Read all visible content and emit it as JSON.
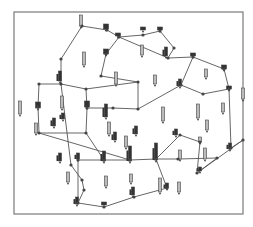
{
  "diagram": {
    "type": "network-graph-with-bar-glyphs",
    "frame": {
      "x": 14,
      "y": 12,
      "w": 229,
      "h": 202,
      "stroke": "#7a7a7a"
    },
    "colors": {
      "edge": "#555555",
      "node": "#444444",
      "bar_dark": "#333333",
      "bar_light": "#bbbbbb",
      "bar_outline": "#444444"
    },
    "nodes": [
      {
        "id": 1,
        "x": 82,
        "y": 26
      },
      {
        "id": 2,
        "x": 107,
        "y": 30
      },
      {
        "id": 3,
        "x": 119,
        "y": 37
      },
      {
        "id": 4,
        "x": 143,
        "y": 35
      },
      {
        "id": 5,
        "x": 160,
        "y": 31
      },
      {
        "id": 6,
        "x": 174,
        "y": 48
      },
      {
        "id": 7,
        "x": 168,
        "y": 58
      },
      {
        "id": 8,
        "x": 193,
        "y": 57
      },
      {
        "id": 9,
        "x": 106,
        "y": 54
      },
      {
        "id": 10,
        "x": 61,
        "y": 59
      },
      {
        "id": 11,
        "x": 61,
        "y": 84
      },
      {
        "id": 12,
        "x": 39,
        "y": 84
      },
      {
        "id": 13,
        "x": 101,
        "y": 76
      },
      {
        "id": 14,
        "x": 86,
        "y": 89
      },
      {
        "id": 15,
        "x": 138,
        "y": 82
      },
      {
        "id": 16,
        "x": 224,
        "y": 69
      },
      {
        "id": 17,
        "x": 181,
        "y": 85
      },
      {
        "id": 18,
        "x": 203,
        "y": 94
      },
      {
        "id": 19,
        "x": 229,
        "y": 89
      },
      {
        "id": 20,
        "x": 38,
        "y": 107
      },
      {
        "id": 21,
        "x": 87,
        "y": 108
      },
      {
        "id": 22,
        "x": 113,
        "y": 108
      },
      {
        "id": 23,
        "x": 138,
        "y": 109
      },
      {
        "id": 24,
        "x": 39,
        "y": 133
      },
      {
        "id": 25,
        "x": 86,
        "y": 133
      },
      {
        "id": 26,
        "x": 180,
        "y": 135
      },
      {
        "id": 27,
        "x": 200,
        "y": 142
      },
      {
        "id": 28,
        "x": 243,
        "y": 140
      },
      {
        "id": 29,
        "x": 231,
        "y": 148
      },
      {
        "id": 30,
        "x": 130,
        "y": 160
      },
      {
        "id": 31,
        "x": 156,
        "y": 159
      },
      {
        "id": 32,
        "x": 78,
        "y": 160
      },
      {
        "id": 33,
        "x": 104,
        "y": 160
      },
      {
        "id": 34,
        "x": 178,
        "y": 159
      },
      {
        "id": 35,
        "x": 217,
        "y": 158
      },
      {
        "id": 36,
        "x": 197,
        "y": 173
      },
      {
        "id": 37,
        "x": 167,
        "y": 188
      },
      {
        "id": 38,
        "x": 134,
        "y": 197
      },
      {
        "id": 39,
        "x": 104,
        "y": 207
      },
      {
        "id": 40,
        "x": 78,
        "y": 203
      },
      {
        "id": 41,
        "x": 71,
        "y": 165
      },
      {
        "id": 42,
        "x": 82,
        "y": 180
      },
      {
        "id": 43,
        "x": 84,
        "y": 190
      }
    ],
    "edges": [
      [
        1,
        2
      ],
      [
        2,
        3
      ],
      [
        3,
        4
      ],
      [
        4,
        5
      ],
      [
        5,
        6
      ],
      [
        3,
        7
      ],
      [
        6,
        7
      ],
      [
        7,
        8
      ],
      [
        1,
        10
      ],
      [
        10,
        11
      ],
      [
        11,
        12
      ],
      [
        11,
        14
      ],
      [
        14,
        15
      ],
      [
        15,
        13
      ],
      [
        13,
        9
      ],
      [
        9,
        3
      ],
      [
        15,
        23
      ],
      [
        14,
        21
      ],
      [
        21,
        22
      ],
      [
        22,
        23
      ],
      [
        23,
        17
      ],
      [
        17,
        8
      ],
      [
        8,
        16
      ],
      [
        16,
        19
      ],
      [
        19,
        29
      ],
      [
        17,
        18
      ],
      [
        18,
        19
      ],
      [
        12,
        20
      ],
      [
        20,
        24
      ],
      [
        24,
        25
      ],
      [
        25,
        21
      ],
      [
        25,
        33
      ],
      [
        24,
        30
      ],
      [
        30,
        31
      ],
      [
        31,
        34
      ],
      [
        34,
        35
      ],
      [
        35,
        36
      ],
      [
        36,
        28
      ],
      [
        28,
        29
      ],
      [
        26,
        27
      ],
      [
        27,
        36
      ],
      [
        26,
        31
      ],
      [
        32,
        33
      ],
      [
        33,
        30
      ],
      [
        31,
        37
      ],
      [
        37,
        38
      ],
      [
        11,
        41
      ],
      [
        41,
        42
      ],
      [
        42,
        43
      ],
      [
        43,
        40
      ],
      [
        40,
        39
      ],
      [
        39,
        38
      ],
      [
        32,
        40
      ]
    ],
    "glyphs": [
      {
        "x": 81,
        "y": 15,
        "h": 11,
        "style": "light"
      },
      {
        "x": 106,
        "y": 24,
        "h": 5,
        "style": "dark-cap"
      },
      {
        "x": 118,
        "y": 33,
        "h": 3,
        "style": "dark-cap"
      },
      {
        "x": 84,
        "y": 52,
        "h": 13,
        "style": "light"
      },
      {
        "x": 106,
        "y": 49,
        "h": 5,
        "style": "dark-cap"
      },
      {
        "x": 143,
        "y": 27,
        "h": 3,
        "style": "dark-cap"
      },
      {
        "x": 160,
        "y": 27,
        "h": 3,
        "style": "dark-cap"
      },
      {
        "x": 142,
        "y": 45,
        "h": 10,
        "style": "light"
      },
      {
        "x": 166,
        "y": 47,
        "h": 9,
        "style": "dark"
      },
      {
        "x": 193,
        "y": 53,
        "h": 3,
        "style": "dark-cap"
      },
      {
        "x": 60,
        "y": 71,
        "h": 10,
        "style": "dark"
      },
      {
        "x": 62,
        "y": 96,
        "h": 12,
        "style": "light"
      },
      {
        "x": 116,
        "y": 72,
        "h": 12,
        "style": "light"
      },
      {
        "x": 155,
        "y": 75,
        "h": 9,
        "style": "light"
      },
      {
        "x": 20,
        "y": 101,
        "h": 13,
        "style": "light"
      },
      {
        "x": 38,
        "y": 102,
        "h": 6,
        "style": "dark-cap"
      },
      {
        "x": 87,
        "y": 101,
        "h": 6,
        "style": "dark-cap"
      },
      {
        "x": 163,
        "y": 107,
        "h": 14,
        "style": "light"
      },
      {
        "x": 180,
        "y": 79,
        "h": 7,
        "style": "dark"
      },
      {
        "x": 206,
        "y": 69,
        "h": 8,
        "style": "light"
      },
      {
        "x": 224,
        "y": 65,
        "h": 4,
        "style": "dark-cap"
      },
      {
        "x": 243,
        "y": 88,
        "h": 11,
        "style": "light"
      },
      {
        "x": 229,
        "y": 86,
        "h": 3,
        "style": "dark-cap"
      },
      {
        "x": 36,
        "y": 123,
        "h": 10,
        "style": "light"
      },
      {
        "x": 54,
        "y": 118,
        "h": 8,
        "style": "dark"
      },
      {
        "x": 63,
        "y": 113,
        "h": 6,
        "style": "dark"
      },
      {
        "x": 106,
        "y": 104,
        "h": 13,
        "style": "dark"
      },
      {
        "x": 109,
        "y": 122,
        "h": 12,
        "style": "light"
      },
      {
        "x": 115,
        "y": 132,
        "h": 8,
        "style": "dark"
      },
      {
        "x": 126,
        "y": 136,
        "h": 11,
        "style": "light"
      },
      {
        "x": 136,
        "y": 126,
        "h": 8,
        "style": "dark"
      },
      {
        "x": 176,
        "y": 129,
        "h": 6,
        "style": "dark"
      },
      {
        "x": 198,
        "y": 104,
        "h": 14,
        "style": "light"
      },
      {
        "x": 200,
        "y": 137,
        "h": 5,
        "style": "light"
      },
      {
        "x": 223,
        "y": 103,
        "h": 9,
        "style": "light"
      },
      {
        "x": 60,
        "y": 153,
        "h": 8,
        "style": "dark"
      },
      {
        "x": 78,
        "y": 153,
        "h": 6,
        "style": "dark"
      },
      {
        "x": 104,
        "y": 151,
        "h": 10,
        "style": "dark"
      },
      {
        "x": 130,
        "y": 146,
        "h": 15,
        "style": "dark"
      },
      {
        "x": 156,
        "y": 143,
        "h": 17,
        "style": "dark"
      },
      {
        "x": 180,
        "y": 150,
        "h": 9,
        "style": "light"
      },
      {
        "x": 205,
        "y": 148,
        "h": 11,
        "style": "light"
      },
      {
        "x": 68,
        "y": 172,
        "h": 10,
        "style": "light"
      },
      {
        "x": 106,
        "y": 176,
        "h": 10,
        "style": "light"
      },
      {
        "x": 131,
        "y": 174,
        "h": 8,
        "style": "light"
      },
      {
        "x": 133,
        "y": 187,
        "h": 8,
        "style": "dark"
      },
      {
        "x": 179,
        "y": 182,
        "h": 10,
        "style": "light"
      },
      {
        "x": 160,
        "y": 178,
        "h": 14,
        "style": "light"
      },
      {
        "x": 167,
        "y": 183,
        "h": 5,
        "style": "dark"
      },
      {
        "x": 77,
        "y": 197,
        "h": 7,
        "style": "dark"
      },
      {
        "x": 104,
        "y": 202,
        "h": 3,
        "style": "dark-cap"
      },
      {
        "x": 207,
        "y": 120,
        "h": 10,
        "style": "light"
      },
      {
        "x": 230,
        "y": 143,
        "h": 6,
        "style": "dark"
      },
      {
        "x": 200,
        "y": 167,
        "h": 4,
        "style": "dark"
      }
    ]
  }
}
